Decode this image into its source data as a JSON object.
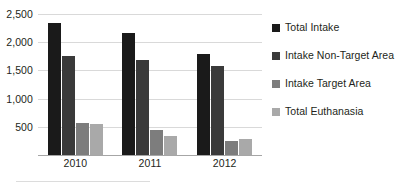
{
  "chart_data": {
    "type": "bar",
    "title": "",
    "xlabel": "",
    "ylabel": "",
    "categories": [
      "2010",
      "2011",
      "2012"
    ],
    "series": [
      {
        "name": "Total Intake",
        "values": [
          2340,
          2160,
          1800
        ],
        "color": "#1a1a1a"
      },
      {
        "name": "Intake Non-Target Area",
        "values": [
          1760,
          1680,
          1580
        ],
        "color": "#3a3a3a"
      },
      {
        "name": "Intake Target Area",
        "values": [
          560,
          450,
          240
        ],
        "color": "#7d7d7d"
      },
      {
        "name": "Total Euthanasia",
        "values": [
          545,
          330,
          290
        ],
        "color": "#a9a9a9"
      }
    ],
    "ylim": [
      0,
      2750
    ],
    "yticks": [
      500,
      1000,
      1500,
      2000,
      2500
    ],
    "ytick_labels": [
      "500",
      "1,000",
      "1,500",
      "2,000",
      "2,500"
    ],
    "grid": true,
    "legend_position": "right"
  },
  "legend": {
    "items": [
      {
        "label": "Total Intake"
      },
      {
        "label": "Intake Non-Target Area"
      },
      {
        "label": "Intake Target Area"
      },
      {
        "label": "Total Euthanasia"
      }
    ]
  }
}
